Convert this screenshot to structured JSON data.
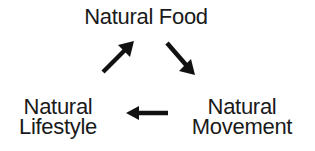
{
  "diagram": {
    "type": "cycle",
    "nodes": [
      {
        "id": "food",
        "lines": [
          "Natural Food"
        ]
      },
      {
        "id": "movement",
        "lines": [
          "Natural",
          "Movement"
        ]
      },
      {
        "id": "lifestyle",
        "lines": [
          "Natural",
          "Lifestyle"
        ]
      }
    ],
    "edges": [
      {
        "from": "food",
        "to": "movement",
        "icon": "arrow-down-right-icon"
      },
      {
        "from": "movement",
        "to": "lifestyle",
        "icon": "arrow-left-icon"
      },
      {
        "from": "lifestyle",
        "to": "food",
        "icon": "arrow-up-right-icon"
      }
    ],
    "colors": {
      "text": "#1a1a1a",
      "arrow": "#111111",
      "background": "#ffffff"
    }
  }
}
